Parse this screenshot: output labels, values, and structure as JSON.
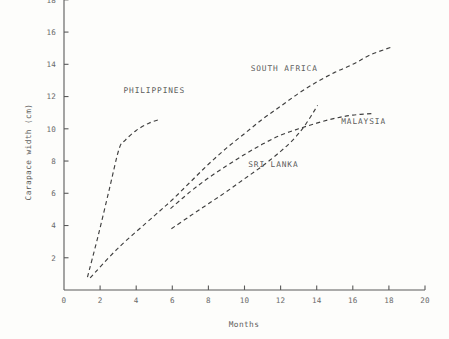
{
  "chart_data": {
    "type": "line",
    "title": "",
    "xlabel": "Months",
    "ylabel": "Carapace width (cm)",
    "xlim": [
      0,
      20
    ],
    "ylim": [
      0,
      18
    ],
    "xticks": [
      "0",
      "2",
      "4",
      "6",
      "8",
      "10",
      "12",
      "14",
      "16",
      "18",
      "20"
    ],
    "xtick_values": [
      0,
      2,
      4,
      6,
      8,
      10,
      12,
      14,
      16,
      18,
      20
    ],
    "yticks": [
      "2",
      "4",
      "6",
      "8",
      "10",
      "12",
      "14",
      "16",
      "18"
    ],
    "ytick_values": [
      2,
      4,
      6,
      8,
      10,
      12,
      14,
      16,
      18
    ],
    "grid": false,
    "legend_position": "inline-annotations",
    "line_style": "dashed",
    "series": [
      {
        "name": "PHILIPPINES",
        "label_x": 5.0,
        "label_y": 12.2,
        "points": [
          [
            1.3,
            0.8
          ],
          [
            1.9,
            3.4
          ],
          [
            2.5,
            6.2
          ],
          [
            3.05,
            8.75
          ],
          [
            3.4,
            9.3
          ],
          [
            4.0,
            9.9
          ],
          [
            4.7,
            10.35
          ],
          [
            5.35,
            10.6
          ]
        ]
      },
      {
        "name": "SOUTH AFRICA",
        "label_x": 12.2,
        "label_y": 13.6,
        "points": [
          [
            1.45,
            0.75
          ],
          [
            3.0,
            2.6
          ],
          [
            5.0,
            4.6
          ],
          [
            6.0,
            5.6
          ],
          [
            7.0,
            6.7
          ],
          [
            8.0,
            7.8
          ],
          [
            9.0,
            8.8
          ],
          [
            10.0,
            9.7
          ],
          [
            11.0,
            10.6
          ],
          [
            12.0,
            11.4
          ],
          [
            13.0,
            12.2
          ],
          [
            14.0,
            12.9
          ],
          [
            15.0,
            13.5
          ],
          [
            16.0,
            14.0
          ],
          [
            17.0,
            14.6
          ],
          [
            18.1,
            15.05
          ]
        ]
      },
      {
        "name": "MALAYSIA",
        "label_x": 16.6,
        "label_y": 10.3,
        "points": [
          [
            5.9,
            5.05
          ],
          [
            7.0,
            6.1
          ],
          [
            8.0,
            6.95
          ],
          [
            9.0,
            7.7
          ],
          [
            10.0,
            8.4
          ],
          [
            11.0,
            9.05
          ],
          [
            12.0,
            9.6
          ],
          [
            13.0,
            10.0
          ],
          [
            14.0,
            10.35
          ],
          [
            15.0,
            10.65
          ],
          [
            16.0,
            10.85
          ],
          [
            17.1,
            10.95
          ]
        ]
      },
      {
        "name": "SRI LANKA",
        "label_x": 11.6,
        "label_y": 7.6,
        "points": [
          [
            5.95,
            3.8
          ],
          [
            7.0,
            4.6
          ],
          [
            8.0,
            5.35
          ],
          [
            9.0,
            6.1
          ],
          [
            10.0,
            6.9
          ],
          [
            11.0,
            7.7
          ],
          [
            12.0,
            8.6
          ],
          [
            12.8,
            9.45
          ],
          [
            13.4,
            10.3
          ],
          [
            14.05,
            11.45
          ]
        ]
      }
    ]
  }
}
